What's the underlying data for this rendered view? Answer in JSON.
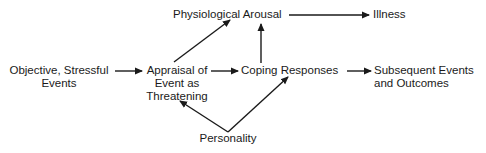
{
  "diagram": {
    "type": "flow",
    "nodes": {
      "physiological_arousal": {
        "lines": [
          "Physiological Arousal"
        ]
      },
      "illness": {
        "lines": [
          "Illness"
        ]
      },
      "objective_events": {
        "lines": [
          "Objective, Stressful",
          "Events"
        ]
      },
      "appraisal": {
        "lines": [
          "Appraisal of",
          "Event as",
          "Threatening"
        ]
      },
      "coping": {
        "lines": [
          "Coping Responses"
        ]
      },
      "subsequent": {
        "lines": [
          "Subsequent Events",
          "and Outcomes"
        ]
      },
      "personality": {
        "lines": [
          "Personality"
        ]
      }
    },
    "edges": [
      {
        "from": "objective_events",
        "to": "appraisal"
      },
      {
        "from": "appraisal",
        "to": "coping"
      },
      {
        "from": "appraisal",
        "to": "physiological_arousal"
      },
      {
        "from": "coping",
        "to": "physiological_arousal"
      },
      {
        "from": "physiological_arousal",
        "to": "illness"
      },
      {
        "from": "coping",
        "to": "subsequent"
      },
      {
        "from": "personality",
        "to": "appraisal"
      },
      {
        "from": "personality",
        "to": "coping"
      }
    ],
    "colors": {
      "ink": "#1a1a1a",
      "background": "#ffffff"
    }
  }
}
